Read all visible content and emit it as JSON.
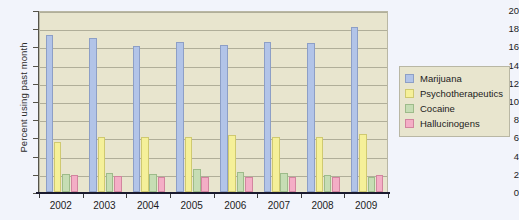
{
  "chart_data": {
    "type": "bar",
    "title": "",
    "subtitle": "",
    "xlabel": "",
    "ylabel": "Percent using past month",
    "categories": [
      "2002",
      "2003",
      "2004",
      "2005",
      "2006",
      "2007",
      "2008",
      "2009"
    ],
    "ylim": [
      0,
      20
    ],
    "yticks": [
      0,
      2,
      4,
      6,
      8,
      10,
      12,
      14,
      16,
      18,
      20
    ],
    "ytick_labels": [
      "0",
      "2",
      "4",
      "6",
      "8",
      "10",
      "12",
      "14",
      "16",
      "18",
      "20"
    ],
    "grid": true,
    "legend_position": "right",
    "series": [
      {
        "name": "Marijuana",
        "color": "#b2c4e8",
        "values": [
          17.3,
          16.9,
          16.1,
          16.5,
          16.2,
          16.5,
          16.4,
          18.1
        ]
      },
      {
        "name": "Psychotherapeutics",
        "color": "#f5f099",
        "values": [
          5.5,
          6.0,
          6.0,
          6.1,
          6.3,
          6.0,
          6.0,
          6.4
        ]
      },
      {
        "name": "Cocaine",
        "color": "#c6ddb4",
        "values": [
          2.0,
          2.1,
          2.0,
          2.5,
          2.2,
          2.1,
          1.9,
          1.7
        ]
      },
      {
        "name": "Hallucinogens",
        "color": "#f4aec6",
        "values": [
          1.9,
          1.8,
          1.6,
          1.6,
          1.7,
          1.6,
          1.6,
          1.9
        ]
      }
    ]
  },
  "colors": {
    "plot_background": "#e8e5ce",
    "page_background": "#f2f4fb",
    "gridline": "#b0ae99",
    "axis": "#1a1a2e",
    "plot_border": "#b9b7a4"
  }
}
